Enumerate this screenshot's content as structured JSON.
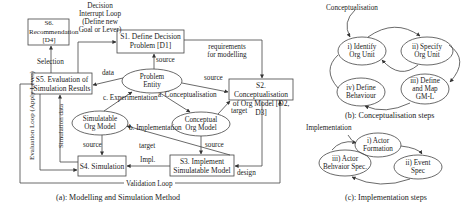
{
  "panel_a": {
    "caption": "(a): Modelling and Simulation Method",
    "boxes": {
      "s1": "S1. Define Decision Problem [D1]",
      "s2": "S2. Conceptualisation of Org Model [D2, D3]",
      "s3": "S3. Implement Simulatable Model",
      "s4": "S4. Simulation",
      "s5": "S5. Evaluation of Simulation Results",
      "s6": "S6. Recommendation [D4]"
    },
    "ellipses": {
      "problem": "Problem Entity",
      "conceptual": "Conceptual Org Model",
      "simulatable": "Simulatable Org Model"
    },
    "edge_labels": {
      "decision_loop": "Decision Interrupt Loop (Define new Goal or Lever)",
      "requirements": "requirements for modelling",
      "source_s1": "source",
      "source_s2": "source",
      "data": "data",
      "selection": "Selection",
      "conceptualisation": "a. Conceptualisation",
      "experimentation": "c. Experimentation",
      "implementation": "b. Implementation",
      "target_s2": "target",
      "target_s3": "target",
      "source_s3": "source",
      "source_s4": "source",
      "impl": "Impl.",
      "design": "design",
      "evaluation_loop": "Evaluation Loop (Apply Lever)",
      "simulation_data": "Simulation data",
      "validation_loop": "Validation Loop"
    }
  },
  "panel_b": {
    "caption": "(b): Conceptualisation steps",
    "entry_label": "Conceptualisation",
    "steps": [
      "i) Identify Org Unit",
      "ii) Specify Org Unit",
      "iii) Define and Map GM-L",
      "iv) Define Behaviour"
    ]
  },
  "panel_c": {
    "caption": "(c): Implementation steps",
    "entry_label": "Implementation",
    "steps": [
      "i) Actor Formation",
      "ii) Event Spec",
      "iii) Actor Behvaior Spec."
    ]
  }
}
